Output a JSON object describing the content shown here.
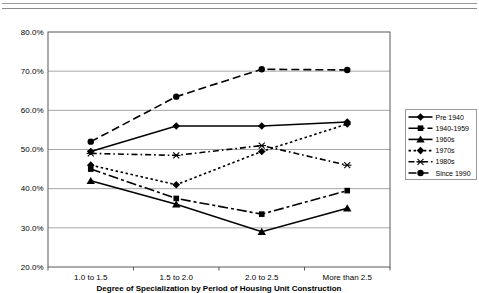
{
  "chart_data": {
    "type": "line",
    "title": "",
    "xlabel": "Degree of Specialization by Period of Housing Unit Construction",
    "ylabel": "",
    "ylim": [
      20,
      80
    ],
    "grid": true,
    "legend_position": "right",
    "yticks": [
      {
        "value": 80,
        "label": "80.0%"
      },
      {
        "value": 70,
        "label": "70.0%"
      },
      {
        "value": 60,
        "label": "60.0%"
      },
      {
        "value": 50,
        "label": "50.0%"
      },
      {
        "value": 40,
        "label": "40.0%"
      },
      {
        "value": 30,
        "label": "30.0%"
      },
      {
        "value": 20,
        "label": "20.0%"
      }
    ],
    "categories": [
      "1.0 to 1.5",
      "1.5 to 2.0",
      "2.0 to 2.5",
      "More than 2.5"
    ],
    "series": [
      {
        "name": "Pre 1940",
        "marker": "diamond",
        "line": "solid",
        "color": "#000000",
        "values": [
          49.5,
          56.0,
          56.0,
          57.0
        ]
      },
      {
        "name": "1940-1959",
        "marker": "square",
        "line": "dashdotlong",
        "color": "#000000",
        "values": [
          45.0,
          37.5,
          33.5,
          39.5
        ]
      },
      {
        "name": "1960s",
        "marker": "triangle",
        "line": "solid",
        "color": "#000000",
        "values": [
          42.0,
          36.0,
          29.0,
          35.0
        ]
      },
      {
        "name": "1970s",
        "marker": "diamond",
        "line": "dot",
        "color": "#000000",
        "values": [
          46.0,
          41.0,
          49.5,
          56.5
        ]
      },
      {
        "name": "1980s",
        "marker": "star",
        "line": "dashdot",
        "color": "#000000",
        "values": [
          49.0,
          48.5,
          51.0,
          46.0
        ]
      },
      {
        "name": "Since 1990",
        "marker": "circle",
        "line": "dash",
        "color": "#000000",
        "values": [
          52.0,
          63.5,
          70.5,
          70.3
        ]
      }
    ]
  },
  "colors": {
    "plot_border": "#595959",
    "gridline": "#a6a6a6",
    "text": "#000000",
    "legend_border": "#999999",
    "header_rule": "#9a9a9a",
    "background": "#ffffff"
  }
}
